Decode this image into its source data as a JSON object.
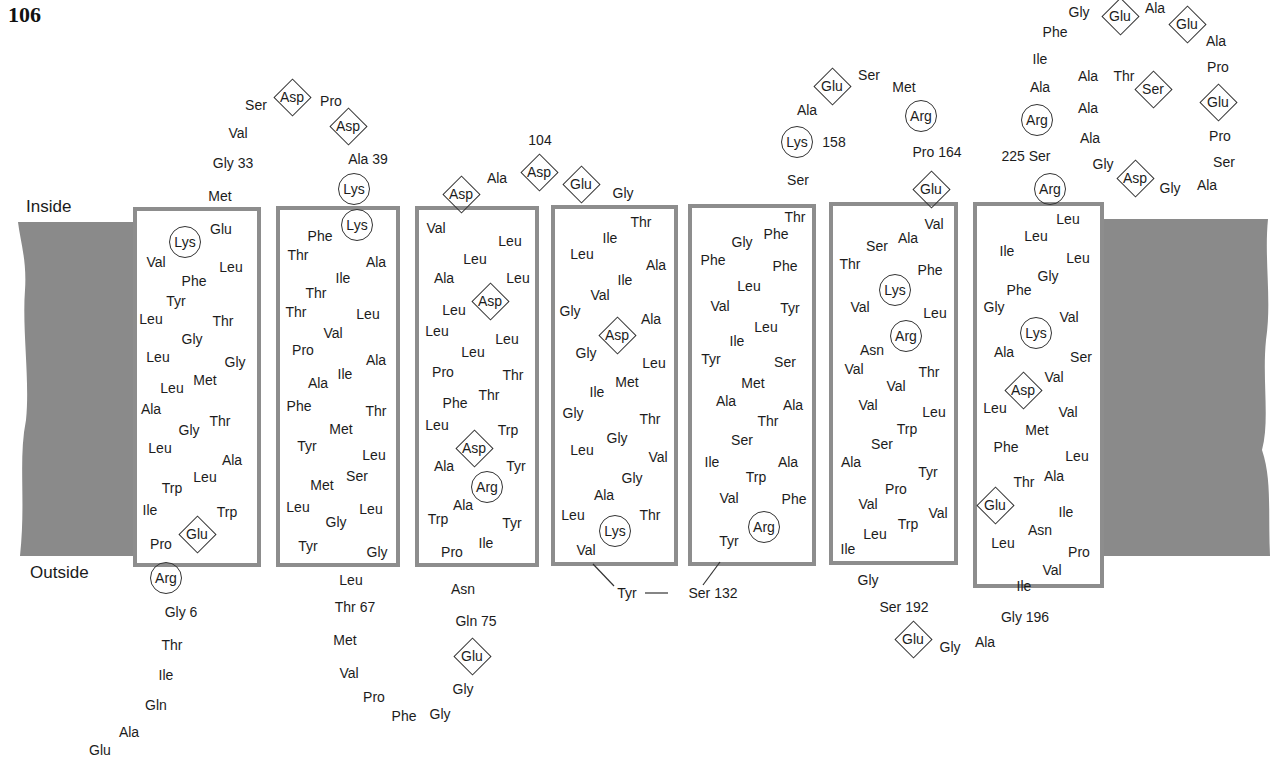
{
  "page_number": "106",
  "labels": {
    "inside": "Inside",
    "outside": "Outside"
  },
  "colors": {
    "membrane": "#8a8a8a",
    "box_border": "#8d8d8d",
    "text": "#1c1c1c"
  },
  "helices": [
    {
      "x": 133,
      "y": 207,
      "w": 128,
      "h": 360
    },
    {
      "x": 276,
      "y": 206,
      "w": 124,
      "h": 361
    },
    {
      "x": 415,
      "y": 206,
      "w": 124,
      "h": 361
    },
    {
      "x": 551,
      "y": 205,
      "w": 127,
      "h": 361
    },
    {
      "x": 688,
      "y": 204,
      "w": 128,
      "h": 362
    },
    {
      "x": 829,
      "y": 202,
      "w": 129,
      "h": 363
    },
    {
      "x": 973,
      "y": 202,
      "w": 131,
      "h": 386
    }
  ],
  "residues": [
    {
      "t": "Val",
      "x": 238,
      "y": 133
    },
    {
      "t": "Ser",
      "x": 256,
      "y": 105
    },
    {
      "t": "Asp",
      "x": 292,
      "y": 97,
      "s": "diamond"
    },
    {
      "t": "Pro",
      "x": 331,
      "y": 101
    },
    {
      "t": "Asp",
      "x": 348,
      "y": 126,
      "s": "diamond"
    },
    {
      "t": "Gly 33",
      "x": 233,
      "y": 163
    },
    {
      "t": "Ala 39",
      "x": 368,
      "y": 159
    },
    {
      "t": "Met",
      "x": 220,
      "y": 196
    },
    {
      "t": "Lys",
      "x": 354,
      "y": 189,
      "s": "circle"
    },
    {
      "t": "Glu",
      "x": 221,
      "y": 229
    },
    {
      "t": "Lys",
      "x": 185,
      "y": 242,
      "s": "circle"
    },
    {
      "t": "Val",
      "x": 156,
      "y": 262
    },
    {
      "t": "Leu",
      "x": 231,
      "y": 267
    },
    {
      "t": "Phe",
      "x": 194,
      "y": 281
    },
    {
      "t": "Tyr",
      "x": 176,
      "y": 301
    },
    {
      "t": "Leu",
      "x": 151,
      "y": 319
    },
    {
      "t": "Thr",
      "x": 223,
      "y": 321
    },
    {
      "t": "Gly",
      "x": 192,
      "y": 339
    },
    {
      "t": "Leu",
      "x": 158,
      "y": 357
    },
    {
      "t": "Gly",
      "x": 235,
      "y": 362
    },
    {
      "t": "Met",
      "x": 205,
      "y": 380
    },
    {
      "t": "Leu",
      "x": 172,
      "y": 388
    },
    {
      "t": "Ala",
      "x": 151,
      "y": 409
    },
    {
      "t": "Thr",
      "x": 220,
      "y": 421
    },
    {
      "t": "Gly",
      "x": 189,
      "y": 430
    },
    {
      "t": "Leu",
      "x": 160,
      "y": 448
    },
    {
      "t": "Ala",
      "x": 232,
      "y": 460
    },
    {
      "t": "Leu",
      "x": 205,
      "y": 477
    },
    {
      "t": "Trp",
      "x": 172,
      "y": 488
    },
    {
      "t": "Ile",
      "x": 150,
      "y": 510
    },
    {
      "t": "Trp",
      "x": 227,
      "y": 512
    },
    {
      "t": "Glu",
      "x": 197,
      "y": 534,
      "s": "diamond"
    },
    {
      "t": "Pro",
      "x": 161,
      "y": 544
    },
    {
      "t": "Arg",
      "x": 166,
      "y": 578,
      "s": "circle"
    },
    {
      "t": "Gly 6",
      "x": 181,
      "y": 612
    },
    {
      "t": "Thr",
      "x": 172,
      "y": 645
    },
    {
      "t": "Ile",
      "x": 166,
      "y": 675
    },
    {
      "t": "Gln",
      "x": 156,
      "y": 705
    },
    {
      "t": "Ala",
      "x": 129,
      "y": 732
    },
    {
      "t": "Glu",
      "x": 100,
      "y": 750
    },
    {
      "t": "Lys",
      "x": 357,
      "y": 225,
      "s": "circle"
    },
    {
      "t": "Phe",
      "x": 320,
      "y": 236
    },
    {
      "t": "Thr",
      "x": 298,
      "y": 255
    },
    {
      "t": "Ala",
      "x": 376,
      "y": 262
    },
    {
      "t": "Ile",
      "x": 343,
      "y": 278
    },
    {
      "t": "Thr",
      "x": 316,
      "y": 293
    },
    {
      "t": "Thr",
      "x": 296,
      "y": 312
    },
    {
      "t": "Leu",
      "x": 368,
      "y": 314
    },
    {
      "t": "Val",
      "x": 333,
      "y": 333
    },
    {
      "t": "Pro",
      "x": 303,
      "y": 350
    },
    {
      "t": "Ala",
      "x": 376,
      "y": 360
    },
    {
      "t": "Ile",
      "x": 345,
      "y": 374
    },
    {
      "t": "Ala",
      "x": 318,
      "y": 383
    },
    {
      "t": "Phe",
      "x": 299,
      "y": 406
    },
    {
      "t": "Thr",
      "x": 376,
      "y": 411
    },
    {
      "t": "Met",
      "x": 341,
      "y": 429
    },
    {
      "t": "Tyr",
      "x": 307,
      "y": 446
    },
    {
      "t": "Leu",
      "x": 374,
      "y": 455
    },
    {
      "t": "Ser",
      "x": 357,
      "y": 476
    },
    {
      "t": "Met",
      "x": 322,
      "y": 485
    },
    {
      "t": "Leu",
      "x": 298,
      "y": 507
    },
    {
      "t": "Leu",
      "x": 371,
      "y": 509
    },
    {
      "t": "Gly",
      "x": 336,
      "y": 522
    },
    {
      "t": "Tyr",
      "x": 308,
      "y": 546
    },
    {
      "t": "Gly",
      "x": 377,
      "y": 552
    },
    {
      "t": "Leu",
      "x": 351,
      "y": 580
    },
    {
      "t": "Thr 67",
      "x": 355,
      "y": 607
    },
    {
      "t": "Met",
      "x": 345,
      "y": 640
    },
    {
      "t": "Val",
      "x": 349,
      "y": 673
    },
    {
      "t": "Pro",
      "x": 374,
      "y": 697
    },
    {
      "t": "Phe",
      "x": 404,
      "y": 716
    },
    {
      "t": "Gly",
      "x": 440,
      "y": 714
    },
    {
      "t": "104",
      "x": 540,
      "y": 140
    },
    {
      "t": "Asp",
      "x": 461,
      "y": 194,
      "s": "diamond"
    },
    {
      "t": "Ala",
      "x": 497,
      "y": 178
    },
    {
      "t": "Asp",
      "x": 539,
      "y": 172,
      "s": "diamond"
    },
    {
      "t": "Glu",
      "x": 581,
      "y": 184,
      "s": "diamond"
    },
    {
      "t": "Gly",
      "x": 623,
      "y": 193
    },
    {
      "t": "Val",
      "x": 436,
      "y": 228
    },
    {
      "t": "Leu",
      "x": 510,
      "y": 241
    },
    {
      "t": "Leu",
      "x": 475,
      "y": 259
    },
    {
      "t": "Ala",
      "x": 444,
      "y": 278
    },
    {
      "t": "Leu",
      "x": 518,
      "y": 278
    },
    {
      "t": "Asp",
      "x": 490,
      "y": 301,
      "s": "diamond"
    },
    {
      "t": "Leu",
      "x": 454,
      "y": 310
    },
    {
      "t": "Leu",
      "x": 437,
      "y": 331
    },
    {
      "t": "Leu",
      "x": 507,
      "y": 339
    },
    {
      "t": "Leu",
      "x": 473,
      "y": 352
    },
    {
      "t": "Pro",
      "x": 443,
      "y": 372
    },
    {
      "t": "Thr",
      "x": 513,
      "y": 375
    },
    {
      "t": "Phe",
      "x": 455,
      "y": 403
    },
    {
      "t": "Thr",
      "x": 489,
      "y": 395
    },
    {
      "t": "Leu",
      "x": 437,
      "y": 425
    },
    {
      "t": "Trp",
      "x": 508,
      "y": 430
    },
    {
      "t": "Asp",
      "x": 474,
      "y": 448,
      "s": "diamond"
    },
    {
      "t": "Ala",
      "x": 444,
      "y": 466
    },
    {
      "t": "Tyr",
      "x": 516,
      "y": 466
    },
    {
      "t": "Arg",
      "x": 487,
      "y": 487,
      "s": "circle"
    },
    {
      "t": "Ala",
      "x": 463,
      "y": 505
    },
    {
      "t": "Trp",
      "x": 438,
      "y": 519
    },
    {
      "t": "Tyr",
      "x": 512,
      "y": 523
    },
    {
      "t": "Ile",
      "x": 486,
      "y": 543
    },
    {
      "t": "Pro",
      "x": 452,
      "y": 552
    },
    {
      "t": "Asn",
      "x": 463,
      "y": 589
    },
    {
      "t": "Gln 75",
      "x": 476,
      "y": 621
    },
    {
      "t": "Glu",
      "x": 472,
      "y": 656,
      "s": "diamond"
    },
    {
      "t": "Gly",
      "x": 463,
      "y": 689
    },
    {
      "t": "Thr",
      "x": 641,
      "y": 222
    },
    {
      "t": "Ile",
      "x": 610,
      "y": 238
    },
    {
      "t": "Leu",
      "x": 582,
      "y": 254
    },
    {
      "t": "Ala",
      "x": 656,
      "y": 265
    },
    {
      "t": "Ile",
      "x": 625,
      "y": 280
    },
    {
      "t": "Val",
      "x": 600,
      "y": 295
    },
    {
      "t": "Gly",
      "x": 570,
      "y": 311
    },
    {
      "t": "Ala",
      "x": 651,
      "y": 319
    },
    {
      "t": "Asp",
      "x": 617,
      "y": 335,
      "s": "diamond"
    },
    {
      "t": "Gly",
      "x": 586,
      "y": 353
    },
    {
      "t": "Leu",
      "x": 654,
      "y": 363
    },
    {
      "t": "Met",
      "x": 627,
      "y": 382
    },
    {
      "t": "Ile",
      "x": 597,
      "y": 392
    },
    {
      "t": "Gly",
      "x": 573,
      "y": 413
    },
    {
      "t": "Thr",
      "x": 650,
      "y": 419
    },
    {
      "t": "Gly",
      "x": 617,
      "y": 438
    },
    {
      "t": "Leu",
      "x": 582,
      "y": 450
    },
    {
      "t": "Val",
      "x": 658,
      "y": 457
    },
    {
      "t": "Gly",
      "x": 632,
      "y": 478
    },
    {
      "t": "Ala",
      "x": 604,
      "y": 495
    },
    {
      "t": "Leu",
      "x": 573,
      "y": 515
    },
    {
      "t": "Thr",
      "x": 650,
      "y": 515
    },
    {
      "t": "Lys",
      "x": 615,
      "y": 531,
      "s": "circle"
    },
    {
      "t": "Val",
      "x": 586,
      "y": 550
    },
    {
      "t": "Tyr",
      "x": 627,
      "y": 593
    },
    {
      "t": "Ser 132",
      "x": 713,
      "y": 593
    },
    {
      "t": "Thr",
      "x": 795,
      "y": 217
    },
    {
      "t": "Phe",
      "x": 776,
      "y": 234
    },
    {
      "t": "Gly",
      "x": 742,
      "y": 242
    },
    {
      "t": "Phe",
      "x": 713,
      "y": 260
    },
    {
      "t": "Phe",
      "x": 785,
      "y": 266
    },
    {
      "t": "Leu",
      "x": 749,
      "y": 286
    },
    {
      "t": "Val",
      "x": 720,
      "y": 306
    },
    {
      "t": "Tyr",
      "x": 790,
      "y": 308
    },
    {
      "t": "Leu",
      "x": 766,
      "y": 327
    },
    {
      "t": "Ile",
      "x": 737,
      "y": 341
    },
    {
      "t": "Tyr",
      "x": 711,
      "y": 359
    },
    {
      "t": "Ser",
      "x": 785,
      "y": 362
    },
    {
      "t": "Met",
      "x": 753,
      "y": 383
    },
    {
      "t": "Ala",
      "x": 726,
      "y": 401
    },
    {
      "t": "Ala",
      "x": 793,
      "y": 405
    },
    {
      "t": "Thr",
      "x": 768,
      "y": 421
    },
    {
      "t": "Ser",
      "x": 742,
      "y": 440
    },
    {
      "t": "Ile",
      "x": 712,
      "y": 462
    },
    {
      "t": "Ala",
      "x": 788,
      "y": 462
    },
    {
      "t": "Trp",
      "x": 756,
      "y": 477
    },
    {
      "t": "Val",
      "x": 729,
      "y": 498
    },
    {
      "t": "Phe",
      "x": 794,
      "y": 499
    },
    {
      "t": "Arg",
      "x": 764,
      "y": 527,
      "s": "circle"
    },
    {
      "t": "Tyr",
      "x": 729,
      "y": 541
    },
    {
      "t": "Ser",
      "x": 869,
      "y": 75
    },
    {
      "t": "Glu",
      "x": 832,
      "y": 86,
      "s": "diamond"
    },
    {
      "t": "Met",
      "x": 904,
      "y": 87
    },
    {
      "t": "Ala",
      "x": 807,
      "y": 110
    },
    {
      "t": "Arg",
      "x": 921,
      "y": 116,
      "s": "circle"
    },
    {
      "t": "Lys",
      "x": 797,
      "y": 142,
      "s": "circle"
    },
    {
      "t": "158",
      "x": 834,
      "y": 142
    },
    {
      "t": "Pro 164",
      "x": 937,
      "y": 152
    },
    {
      "t": "Ser",
      "x": 798,
      "y": 180
    },
    {
      "t": "Glu",
      "x": 931,
      "y": 189,
      "s": "diamond"
    },
    {
      "t": "Val",
      "x": 934,
      "y": 224
    },
    {
      "t": "Ala",
      "x": 908,
      "y": 238
    },
    {
      "t": "Ser",
      "x": 877,
      "y": 246
    },
    {
      "t": "Thr",
      "x": 850,
      "y": 264
    },
    {
      "t": "Phe",
      "x": 930,
      "y": 270
    },
    {
      "t": "Lys",
      "x": 895,
      "y": 290,
      "s": "circle"
    },
    {
      "t": "Val",
      "x": 860,
      "y": 307
    },
    {
      "t": "Leu",
      "x": 935,
      "y": 313
    },
    {
      "t": "Arg",
      "x": 906,
      "y": 336,
      "s": "circle"
    },
    {
      "t": "Asn",
      "x": 872,
      "y": 350
    },
    {
      "t": "Val",
      "x": 854,
      "y": 369
    },
    {
      "t": "Thr",
      "x": 929,
      "y": 372
    },
    {
      "t": "Val",
      "x": 896,
      "y": 386
    },
    {
      "t": "Val",
      "x": 868,
      "y": 405
    },
    {
      "t": "Leu",
      "x": 934,
      "y": 412
    },
    {
      "t": "Trp",
      "x": 907,
      "y": 429
    },
    {
      "t": "Ser",
      "x": 882,
      "y": 444
    },
    {
      "t": "Ala",
      "x": 851,
      "y": 462
    },
    {
      "t": "Tyr",
      "x": 928,
      "y": 472
    },
    {
      "t": "Pro",
      "x": 896,
      "y": 489
    },
    {
      "t": "Val",
      "x": 868,
      "y": 504
    },
    {
      "t": "Val",
      "x": 938,
      "y": 513
    },
    {
      "t": "Trp",
      "x": 908,
      "y": 524
    },
    {
      "t": "Leu",
      "x": 875,
      "y": 534
    },
    {
      "t": "Ile",
      "x": 848,
      "y": 549
    },
    {
      "t": "Gly",
      "x": 868,
      "y": 580
    },
    {
      "t": "Ser 192",
      "x": 904,
      "y": 607
    },
    {
      "t": "Glu",
      "x": 913,
      "y": 639,
      "s": "diamond"
    },
    {
      "t": "Gly",
      "x": 950,
      "y": 647
    },
    {
      "t": "Ala",
      "x": 985,
      "y": 642
    },
    {
      "t": "Gly",
      "x": 1079,
      "y": 12
    },
    {
      "t": "Glu",
      "x": 1120,
      "y": 16,
      "s": "diamond"
    },
    {
      "t": "Ala",
      "x": 1155,
      "y": 8
    },
    {
      "t": "Glu",
      "x": 1187,
      "y": 24,
      "s": "diamond"
    },
    {
      "t": "Phe",
      "x": 1055,
      "y": 32
    },
    {
      "t": "Ala",
      "x": 1216,
      "y": 41
    },
    {
      "t": "Ile",
      "x": 1040,
      "y": 59
    },
    {
      "t": "Pro",
      "x": 1218,
      "y": 67
    },
    {
      "t": "Ala",
      "x": 1088,
      "y": 76
    },
    {
      "t": "Thr",
      "x": 1124,
      "y": 76
    },
    {
      "t": "Ser",
      "x": 1153,
      "y": 89,
      "s": "diamond"
    },
    {
      "t": "Ala",
      "x": 1040,
      "y": 87
    },
    {
      "t": "Glu",
      "x": 1218,
      "y": 102,
      "s": "diamond"
    },
    {
      "t": "Ala",
      "x": 1088,
      "y": 108
    },
    {
      "t": "Arg",
      "x": 1037,
      "y": 120,
      "s": "circle"
    },
    {
      "t": "Ala",
      "x": 1090,
      "y": 138
    },
    {
      "t": "Pro",
      "x": 1220,
      "y": 136
    },
    {
      "t": "225 Ser",
      "x": 1026,
      "y": 156
    },
    {
      "t": "Ser",
      "x": 1224,
      "y": 162
    },
    {
      "t": "Gly",
      "x": 1103,
      "y": 164
    },
    {
      "t": "Asp",
      "x": 1135,
      "y": 178,
      "s": "diamond"
    },
    {
      "t": "Gly",
      "x": 1170,
      "y": 188
    },
    {
      "t": "Ala",
      "x": 1207,
      "y": 185
    },
    {
      "t": "Arg",
      "x": 1050,
      "y": 189,
      "s": "circle"
    },
    {
      "t": "Leu",
      "x": 1068,
      "y": 219
    },
    {
      "t": "Leu",
      "x": 1036,
      "y": 236
    },
    {
      "t": "Ile",
      "x": 1007,
      "y": 251
    },
    {
      "t": "Leu",
      "x": 1078,
      "y": 258
    },
    {
      "t": "Gly",
      "x": 1048,
      "y": 276
    },
    {
      "t": "Phe",
      "x": 1019,
      "y": 290
    },
    {
      "t": "Gly",
      "x": 994,
      "y": 307
    },
    {
      "t": "Val",
      "x": 1069,
      "y": 317
    },
    {
      "t": "Lys",
      "x": 1036,
      "y": 333,
      "s": "circle"
    },
    {
      "t": "Ala",
      "x": 1004,
      "y": 352
    },
    {
      "t": "Ser",
      "x": 1081,
      "y": 357
    },
    {
      "t": "Val",
      "x": 1054,
      "y": 377
    },
    {
      "t": "Asp",
      "x": 1023,
      "y": 390,
      "s": "diamond"
    },
    {
      "t": "Leu",
      "x": 995,
      "y": 408
    },
    {
      "t": "Val",
      "x": 1068,
      "y": 412
    },
    {
      "t": "Met",
      "x": 1037,
      "y": 430
    },
    {
      "t": "Phe",
      "x": 1006,
      "y": 447
    },
    {
      "t": "Leu",
      "x": 1077,
      "y": 456
    },
    {
      "t": "Ala",
      "x": 1054,
      "y": 476
    },
    {
      "t": "Thr",
      "x": 1024,
      "y": 482
    },
    {
      "t": "Glu",
      "x": 995,
      "y": 505,
      "s": "diamond"
    },
    {
      "t": "Ile",
      "x": 1066,
      "y": 512
    },
    {
      "t": "Asn",
      "x": 1040,
      "y": 530
    },
    {
      "t": "Leu",
      "x": 1003,
      "y": 543
    },
    {
      "t": "Pro",
      "x": 1079,
      "y": 552
    },
    {
      "t": "Val",
      "x": 1052,
      "y": 570
    },
    {
      "t": "Ile",
      "x": 1024,
      "y": 586
    },
    {
      "t": "Gly 196",
      "x": 1025,
      "y": 617
    }
  ]
}
